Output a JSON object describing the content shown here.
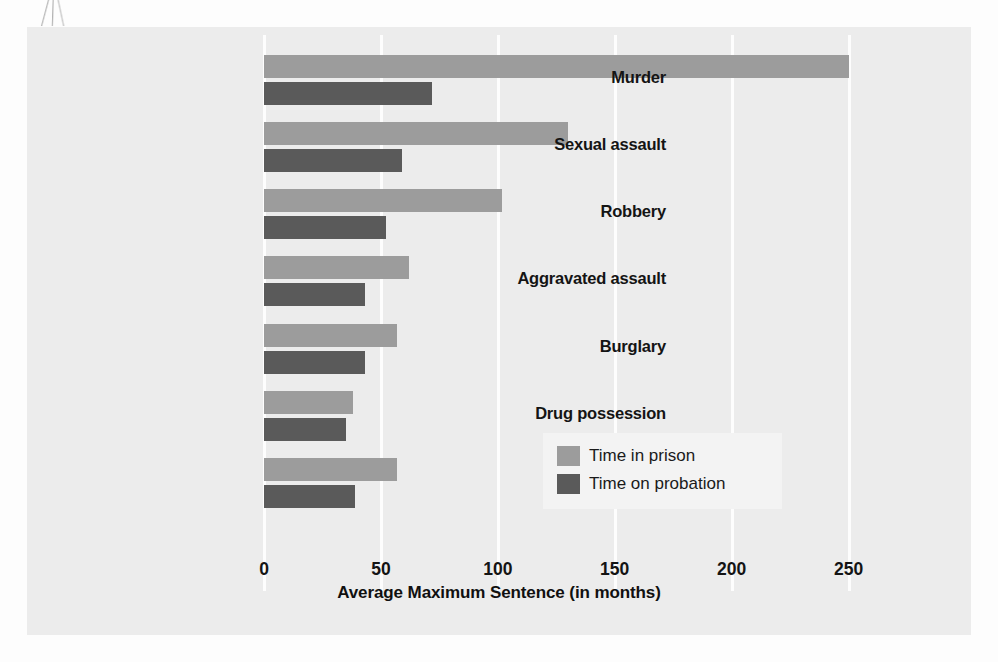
{
  "chart_data": {
    "type": "bar",
    "orientation": "horizontal",
    "title": "",
    "xlabel": "Average Maximum Sentence (in months)",
    "ylabel": "",
    "categories": [
      "Murder",
      "Sexual assault",
      "Robbery",
      "Aggravated assault",
      "Burglary",
      "Drug possession",
      "Drug trafficking"
    ],
    "series": [
      {
        "name": "Time in prison",
        "color": "#9c9c9c",
        "values": [
          250,
          130,
          102,
          62,
          57,
          38,
          57
        ]
      },
      {
        "name": "Time on probation",
        "color": "#5a5a5a",
        "values": [
          72,
          59,
          52,
          43,
          43,
          35,
          39
        ]
      }
    ],
    "xlim": [
      0,
      278
    ],
    "xticks": [
      0,
      50,
      100,
      150,
      200,
      250
    ],
    "xtick_labels": [
      "0",
      "50",
      "100",
      "150",
      "200",
      "250"
    ],
    "grid": "vertical-white-gridlines",
    "legend_position": "bottom-right",
    "plot_background": "#ececec",
    "gridline_color": "#fdfdfd"
  },
  "legend": {
    "items": [
      {
        "label": "Time in prison",
        "color": "#9c9c9c"
      },
      {
        "label": "Time on probation",
        "color": "#5a5a5a"
      }
    ]
  }
}
